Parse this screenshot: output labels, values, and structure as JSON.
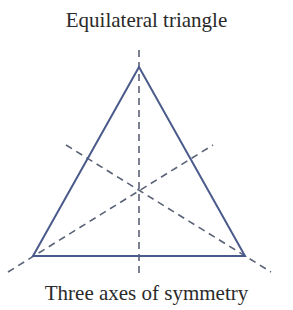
{
  "title": "Equilateral triangle",
  "caption": "Three axes of symmetry",
  "colors": {
    "triangle_stroke": "#4a5a8a",
    "axis_stroke": "#5a6278",
    "text": "#2a2a2a"
  },
  "triangle": {
    "apex": [
      139,
      67
    ],
    "bottom_left": [
      33,
      256
    ],
    "bottom_right": [
      245,
      256
    ]
  },
  "axes_of_symmetry": [
    {
      "name": "vertical",
      "from": [
        139,
        50
      ],
      "to": [
        139,
        276
      ]
    },
    {
      "name": "left-vertex-axis",
      "from": [
        8,
        272
      ],
      "to": [
        213,
        145
      ]
    },
    {
      "name": "right-vertex-axis",
      "from": [
        66,
        145
      ],
      "to": [
        271,
        272
      ]
    }
  ]
}
